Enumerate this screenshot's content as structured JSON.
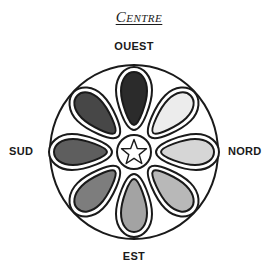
{
  "title": "Centre",
  "directions": {
    "top": "OUEST",
    "right": "NORD",
    "bottom": "EST",
    "left": "SUD"
  },
  "diagram": {
    "center": "star-icon",
    "petal_count": 8,
    "petal_fills": [
      "#2b2b2b",
      "#ececec",
      "#d6d6d6",
      "#b8b8b8",
      "#a3a3a3",
      "#7d7d7d",
      "#5e5e5e",
      "#474747"
    ],
    "stroke_color": "#1a1a1a"
  }
}
